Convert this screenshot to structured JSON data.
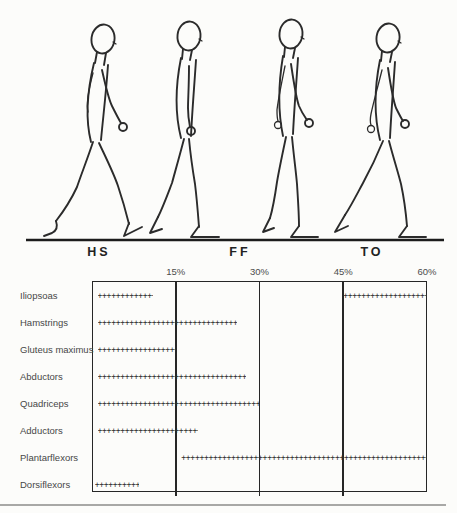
{
  "meta": {
    "background_color": "#fcfcfa",
    "ink_color": "#2b2b2b",
    "divider_color": "#a8a8a6"
  },
  "figure_panel": {
    "figures": [
      {
        "name": "heel-strike",
        "phase_abbrev": "HS"
      },
      {
        "name": "foot-flat",
        "phase_abbrev": "FF"
      },
      {
        "name": "mid-stance",
        "phase_abbrev": ""
      },
      {
        "name": "toe-off",
        "phase_abbrev": "TO"
      }
    ],
    "phase_labels": [
      {
        "label": "HS",
        "x": 99
      },
      {
        "label": "FF",
        "x": 240
      },
      {
        "label": "TO",
        "x": 372
      }
    ]
  },
  "chart_data": {
    "type": "bar",
    "subtype": "gantt-intervals",
    "title": "",
    "x_unit": "percent of gait cycle",
    "x_min": 0,
    "x_max": 60,
    "marker": "+",
    "grid": "vertical gridlines at 15, 30, 45; box edges at 0 and 60",
    "legend": "none",
    "x_ticks": [
      {
        "pct": 15,
        "label": "15%"
      },
      {
        "pct": 30,
        "label": "30%"
      },
      {
        "pct": 45,
        "label": "45%"
      },
      {
        "pct": 60,
        "label": "60%"
      }
    ],
    "rows": [
      {
        "label": "Iliopsoas",
        "bursts": [
          [
            1,
            11
          ],
          [
            45,
            60
          ]
        ]
      },
      {
        "label": "Hamstrings",
        "bursts": [
          [
            1,
            26
          ]
        ]
      },
      {
        "label": "Gluteus maximus",
        "bursts": [
          [
            1,
            15
          ]
        ]
      },
      {
        "label": "Abductors",
        "bursts": [
          [
            1,
            27.5
          ]
        ]
      },
      {
        "label": "Quadriceps",
        "bursts": [
          [
            1,
            30
          ]
        ]
      },
      {
        "label": "Adductors",
        "bursts": [
          [
            1,
            19
          ]
        ]
      },
      {
        "label": "Plantarflexors",
        "bursts": [
          [
            16,
            60
          ]
        ]
      },
      {
        "label": "Dorsiflexors",
        "bursts": [
          [
            0.5,
            8.5
          ]
        ]
      }
    ]
  }
}
